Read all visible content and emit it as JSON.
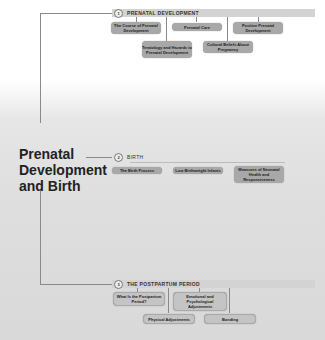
{
  "main_title": [
    "Prenatal",
    "Development",
    "and Birth"
  ],
  "sections": [
    {
      "number": "1",
      "title": "PRENATAL DEVELOPMENT",
      "nodes": [
        {
          "label": "The Course of Prenatal Development"
        },
        {
          "label": "Prenatal Care"
        },
        {
          "label": "Positive Prenatal Development"
        },
        {
          "label": "Teratology and Hazards to Prenatal Development"
        },
        {
          "label": "Cultural Beliefs About Pregnancy"
        }
      ]
    },
    {
      "number": "2",
      "title": "BIRTH",
      "nodes": [
        {
          "label": "The Birth Process"
        },
        {
          "label": "Low Birthweight Infants"
        },
        {
          "label": "Measures of Neonatal Health and Responsiveness"
        }
      ]
    },
    {
      "number": "3",
      "title": "THE POSTPARTUM PERIOD",
      "nodes": [
        {
          "label": "What Is the Postpartum Period?"
        },
        {
          "label": "Emotional and Psychological Adjustments"
        },
        {
          "label": "Physical Adjustments"
        },
        {
          "label": "Bonding"
        }
      ]
    }
  ],
  "colors": {
    "node_fill": "#a8a8a8",
    "section_bar": "#d3d3d3",
    "connector": "#8a8a8a"
  }
}
